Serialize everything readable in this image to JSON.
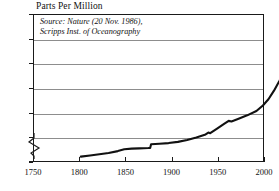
{
  "chart_data": {
    "type": "line",
    "title": "Parts Per Million",
    "xlabel": "",
    "ylabel": "Parts Per Million",
    "xlim": [
      1750,
      2000
    ],
    "ylim": [
      260,
      380
    ],
    "y_axis_break": true,
    "y_break_label": "0",
    "grid": true,
    "legend": "none",
    "annotation_line1": "Source: Nature (20 Nov. 1986),",
    "annotation_line2": "Scripps Inst. of Oceanography",
    "xticks": [
      1750,
      1800,
      1850,
      1900,
      1950,
      2000
    ],
    "xtick_labels": [
      "1750",
      "1800",
      "1850",
      "1900",
      "1950",
      "2000"
    ],
    "yticks": [
      260,
      280,
      300,
      320,
      340,
      360,
      380
    ],
    "ytick_labels": [
      "260",
      "280",
      "300",
      "320",
      "340",
      "360",
      "380"
    ],
    "series_name": "Atmospheric CO2 concentration",
    "x": [
      1765,
      1775,
      1785,
      1795,
      1805,
      1812,
      1820,
      1828,
      1838,
      1840,
      1841,
      1850,
      1860,
      1870,
      1880,
      1890,
      1900,
      1903,
      1905,
      1912,
      1920,
      1925,
      1928,
      1935,
      1945,
      1955,
      1962,
      1968,
      1974,
      1980,
      1986,
      1991,
      1995
    ],
    "y": [
      276.5,
      277.5,
      278.5,
      279.5,
      281.0,
      282.5,
      283.0,
      283.2,
      283.5,
      283.6,
      286.5,
      287.0,
      287.5,
      288.5,
      290.0,
      292.0,
      294.5,
      296.0,
      295.5,
      299.0,
      303.0,
      305.5,
      305.0,
      307.0,
      310.0,
      313.5,
      318.0,
      323.0,
      330.0,
      338.0,
      347.0,
      356.0,
      364.0
    ]
  }
}
